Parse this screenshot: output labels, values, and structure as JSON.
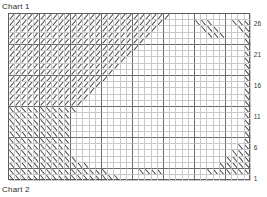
{
  "titles": {
    "top": "Chart 1",
    "bottom": "Chart 2"
  },
  "grid": {
    "columns": 39,
    "rows": 27,
    "cell_size": 6.2,
    "origin_x": 8,
    "origin_y": 13,
    "major_every": 5,
    "line_color": "#c9c9c9",
    "major_line_color": "#6a6a6a",
    "border_color": "#5d5d5d",
    "symbol_color": "#4a4a4a",
    "background": "#ffffff"
  },
  "row_labels": [
    {
      "text": "26",
      "row_from_bottom": 26
    },
    {
      "text": "21",
      "row_from_bottom": 21
    },
    {
      "text": "16",
      "row_from_bottom": 16
    },
    {
      "text": "11",
      "row_from_bottom": 11
    },
    {
      "text": "6",
      "row_from_bottom": 6
    },
    {
      "text": "1",
      "row_from_bottom": 1
    }
  ],
  "legend": {
    "symbol_right": "\\",
    "symbol_left": "/",
    "symbol_right_name": "right-leaning-decrease",
    "symbol_left_name": "left-leaning-decrease"
  },
  "chart_data": {
    "type": "heatmap",
    "title": "Chart 1",
    "subtitle": "Chart 2",
    "xlabel": "",
    "ylabel": "",
    "grid": true,
    "legend_position": "none",
    "x": [
      1,
      2,
      3,
      4,
      5,
      6,
      7,
      8,
      9,
      10,
      11,
      12,
      13,
      14,
      15,
      16,
      17,
      18,
      19,
      20,
      21,
      22,
      23,
      24,
      25,
      26,
      27,
      28,
      29,
      30,
      31,
      32,
      33,
      34,
      35,
      36,
      37,
      38,
      39
    ],
    "categories": [
      26,
      25,
      24,
      23,
      22,
      21,
      20,
      19,
      18,
      17,
      16,
      15,
      14,
      13,
      12,
      11,
      10,
      9,
      8,
      7,
      6,
      5,
      4,
      3,
      2,
      1,
      0
    ],
    "symbol_legend": {
      "0": "empty",
      "1": "right-leaning-decrease",
      "2": "left-leaning-decrease"
    },
    "cells": [
      [
        1,
        1,
        1,
        1,
        1,
        1,
        1,
        1,
        1,
        1,
        1,
        1,
        1,
        1,
        1,
        1,
        1,
        1,
        1,
        1,
        1,
        1,
        1,
        1,
        1,
        1,
        0,
        0,
        0,
        0,
        0,
        0,
        0,
        0,
        0,
        0,
        0,
        0,
        0
      ],
      [
        1,
        1,
        1,
        1,
        1,
        1,
        1,
        1,
        1,
        1,
        1,
        1,
        1,
        1,
        1,
        1,
        1,
        1,
        1,
        1,
        1,
        1,
        1,
        1,
        1,
        0,
        0,
        0,
        0,
        0,
        2,
        2,
        2,
        0,
        0,
        0,
        2,
        2,
        2
      ],
      [
        1,
        1,
        1,
        1,
        1,
        1,
        1,
        1,
        1,
        1,
        1,
        1,
        1,
        1,
        1,
        1,
        1,
        1,
        1,
        1,
        1,
        1,
        1,
        1,
        0,
        0,
        0,
        0,
        0,
        0,
        0,
        2,
        2,
        2,
        0,
        0,
        0,
        2,
        2
      ],
      [
        1,
        1,
        1,
        1,
        1,
        1,
        1,
        1,
        1,
        1,
        1,
        1,
        1,
        1,
        1,
        1,
        1,
        1,
        1,
        1,
        1,
        1,
        1,
        0,
        0,
        0,
        0,
        0,
        0,
        0,
        0,
        0,
        2,
        2,
        2,
        0,
        0,
        0,
        2
      ],
      [
        1,
        1,
        1,
        1,
        1,
        1,
        1,
        1,
        1,
        1,
        1,
        1,
        1,
        1,
        1,
        1,
        1,
        1,
        1,
        1,
        1,
        1,
        0,
        0,
        0,
        0,
        0,
        0,
        0,
        0,
        0,
        0,
        0,
        0,
        0,
        0,
        0,
        0,
        2
      ],
      [
        1,
        1,
        1,
        1,
        1,
        1,
        1,
        1,
        1,
        1,
        1,
        1,
        1,
        1,
        1,
        1,
        1,
        1,
        1,
        1,
        1,
        0,
        0,
        0,
        0,
        0,
        0,
        0,
        0,
        0,
        0,
        0,
        0,
        0,
        0,
        0,
        0,
        0,
        2
      ],
      [
        1,
        1,
        1,
        1,
        1,
        1,
        1,
        1,
        1,
        1,
        1,
        1,
        1,
        1,
        1,
        1,
        1,
        1,
        1,
        1,
        0,
        0,
        0,
        0,
        0,
        0,
        0,
        0,
        0,
        0,
        0,
        0,
        0,
        0,
        0,
        0,
        0,
        0,
        2
      ],
      [
        1,
        1,
        1,
        1,
        1,
        1,
        1,
        1,
        1,
        1,
        1,
        1,
        1,
        1,
        1,
        1,
        1,
        1,
        1,
        0,
        0,
        0,
        0,
        0,
        0,
        0,
        0,
        0,
        0,
        0,
        0,
        0,
        0,
        0,
        0,
        0,
        0,
        0,
        2
      ],
      [
        1,
        1,
        1,
        1,
        1,
        1,
        1,
        1,
        1,
        1,
        1,
        1,
        1,
        1,
        1,
        1,
        1,
        1,
        0,
        0,
        0,
        0,
        0,
        0,
        0,
        0,
        0,
        0,
        0,
        0,
        0,
        0,
        0,
        0,
        0,
        0,
        0,
        0,
        2
      ],
      [
        1,
        1,
        1,
        1,
        1,
        1,
        1,
        1,
        1,
        1,
        1,
        1,
        1,
        1,
        1,
        1,
        1,
        0,
        0,
        0,
        0,
        0,
        0,
        0,
        0,
        0,
        0,
        0,
        0,
        0,
        0,
        0,
        0,
        0,
        0,
        0,
        0,
        0,
        2
      ],
      [
        1,
        1,
        1,
        1,
        1,
        1,
        1,
        1,
        1,
        1,
        1,
        1,
        1,
        1,
        1,
        1,
        0,
        0,
        0,
        0,
        0,
        0,
        0,
        0,
        0,
        0,
        0,
        0,
        0,
        0,
        0,
        0,
        0,
        0,
        0,
        0,
        0,
        0,
        2
      ],
      [
        1,
        1,
        1,
        1,
        1,
        1,
        1,
        1,
        1,
        1,
        1,
        1,
        1,
        1,
        1,
        0,
        0,
        0,
        0,
        0,
        0,
        0,
        0,
        0,
        0,
        0,
        0,
        0,
        0,
        0,
        0,
        0,
        0,
        0,
        0,
        0,
        0,
        0,
        2
      ],
      [
        1,
        1,
        1,
        1,
        1,
        1,
        1,
        1,
        1,
        1,
        1,
        1,
        1,
        1,
        0,
        0,
        0,
        0,
        0,
        0,
        0,
        0,
        0,
        0,
        0,
        0,
        0,
        0,
        0,
        0,
        0,
        0,
        0,
        0,
        0,
        0,
        0,
        0,
        2
      ],
      [
        1,
        1,
        1,
        1,
        1,
        1,
        1,
        1,
        1,
        1,
        1,
        1,
        1,
        0,
        0,
        0,
        0,
        0,
        0,
        0,
        0,
        0,
        0,
        0,
        0,
        0,
        0,
        0,
        0,
        0,
        0,
        0,
        0,
        0,
        0,
        0,
        0,
        0,
        2
      ],
      [
        1,
        1,
        1,
        1,
        1,
        1,
        1,
        1,
        1,
        1,
        1,
        1,
        0,
        0,
        0,
        0,
        0,
        0,
        0,
        0,
        0,
        0,
        0,
        0,
        0,
        0,
        0,
        0,
        0,
        0,
        0,
        0,
        0,
        0,
        0,
        0,
        0,
        0,
        2
      ],
      [
        2,
        2,
        2,
        2,
        2,
        2,
        2,
        2,
        2,
        2,
        2,
        0,
        0,
        0,
        0,
        0,
        0,
        0,
        0,
        0,
        0,
        0,
        0,
        0,
        0,
        0,
        0,
        0,
        0,
        0,
        0,
        0,
        0,
        0,
        0,
        0,
        0,
        0,
        2
      ],
      [
        2,
        2,
        2,
        2,
        2,
        2,
        2,
        2,
        2,
        2,
        0,
        0,
        0,
        0,
        0,
        0,
        0,
        0,
        0,
        0,
        0,
        0,
        0,
        0,
        0,
        0,
        0,
        0,
        0,
        0,
        0,
        0,
        0,
        0,
        0,
        0,
        0,
        0,
        2
      ],
      [
        2,
        2,
        2,
        2,
        2,
        2,
        2,
        2,
        2,
        2,
        0,
        0,
        0,
        0,
        0,
        0,
        0,
        0,
        0,
        0,
        0,
        0,
        0,
        0,
        0,
        0,
        0,
        0,
        0,
        0,
        0,
        0,
        0,
        0,
        0,
        0,
        0,
        0,
        2
      ],
      [
        2,
        2,
        2,
        2,
        2,
        2,
        2,
        2,
        2,
        2,
        0,
        0,
        0,
        0,
        0,
        0,
        0,
        0,
        0,
        0,
        0,
        0,
        0,
        0,
        0,
        0,
        0,
        0,
        0,
        0,
        0,
        0,
        0,
        0,
        0,
        0,
        0,
        0,
        2
      ],
      [
        2,
        2,
        2,
        2,
        2,
        2,
        2,
        2,
        2,
        2,
        0,
        0,
        0,
        0,
        0,
        0,
        0,
        0,
        0,
        0,
        0,
        0,
        0,
        0,
        0,
        0,
        0,
        0,
        0,
        0,
        0,
        0,
        0,
        0,
        0,
        0,
        0,
        0,
        2
      ],
      [
        2,
        2,
        2,
        2,
        2,
        2,
        2,
        2,
        2,
        2,
        0,
        0,
        0,
        0,
        0,
        0,
        0,
        0,
        0,
        0,
        0,
        0,
        0,
        0,
        0,
        0,
        0,
        0,
        0,
        0,
        0,
        0,
        0,
        0,
        0,
        0,
        0,
        0,
        2
      ],
      [
        2,
        2,
        2,
        2,
        2,
        2,
        2,
        2,
        2,
        2,
        0,
        0,
        0,
        0,
        0,
        0,
        0,
        0,
        0,
        0,
        0,
        0,
        0,
        0,
        0,
        0,
        0,
        0,
        0,
        0,
        0,
        0,
        0,
        0,
        0,
        0,
        0,
        2,
        2
      ],
      [
        2,
        2,
        2,
        2,
        2,
        2,
        2,
        2,
        2,
        2,
        0,
        0,
        0,
        0,
        0,
        0,
        0,
        0,
        0,
        0,
        0,
        0,
        0,
        0,
        0,
        0,
        0,
        0,
        0,
        0,
        0,
        0,
        0,
        0,
        0,
        0,
        2,
        2,
        2
      ],
      [
        2,
        2,
        2,
        2,
        2,
        2,
        2,
        2,
        2,
        2,
        2,
        0,
        0,
        0,
        0,
        0,
        0,
        0,
        0,
        0,
        0,
        0,
        0,
        0,
        0,
        0,
        0,
        0,
        0,
        0,
        0,
        0,
        0,
        0,
        0,
        2,
        2,
        2,
        2
      ],
      [
        2,
        2,
        2,
        2,
        2,
        2,
        2,
        2,
        2,
        2,
        2,
        2,
        2,
        0,
        0,
        0,
        0,
        0,
        0,
        0,
        0,
        0,
        0,
        0,
        0,
        0,
        0,
        0,
        0,
        0,
        0,
        0,
        0,
        0,
        2,
        2,
        2,
        2,
        2
      ],
      [
        2,
        2,
        2,
        2,
        2,
        2,
        2,
        2,
        2,
        2,
        2,
        2,
        2,
        2,
        2,
        2,
        0,
        0,
        0,
        0,
        0,
        2,
        2,
        2,
        2,
        0,
        0,
        0,
        0,
        0,
        0,
        0,
        2,
        2,
        2,
        2,
        2,
        2,
        2
      ],
      [
        2,
        2,
        2,
        2,
        2,
        2,
        2,
        2,
        2,
        2,
        2,
        2,
        2,
        2,
        2,
        2,
        2,
        2,
        0,
        0,
        0,
        0,
        0,
        0,
        0,
        0,
        0,
        0,
        0,
        0,
        0,
        0,
        0,
        0,
        0,
        0,
        0,
        0,
        0
      ]
    ]
  }
}
